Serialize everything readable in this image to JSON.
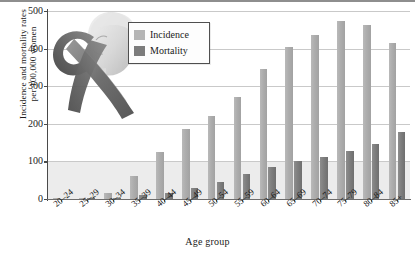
{
  "chart_data": {
    "type": "bar",
    "title": "",
    "xlabel": "Age group",
    "ylabel": "Incidence and mortality rates per 100,000 women",
    "ylabel_line1": "Incidence and mortality rates",
    "ylabel_line2": "per 100,000 women",
    "ylim": [
      0,
      500
    ],
    "yticks": [
      0,
      100,
      200,
      300,
      400,
      500
    ],
    "ytick_labels": [
      "0",
      "100",
      "200",
      "300",
      "400",
      "500"
    ],
    "grid": true,
    "legend_position": "top-left-inset",
    "categories": [
      "20–24",
      "25–29",
      "30–34",
      "35–39",
      "40–44",
      "45–49",
      "50–54",
      "55–59",
      "60–64",
      "65–69",
      "70–74",
      "75–79",
      "80–84",
      "85+"
    ],
    "series": [
      {
        "name": "Incidence",
        "color": "#b0b0b0",
        "values": [
          1,
          2,
          17,
          62,
          125,
          187,
          220,
          272,
          345,
          405,
          435,
          473,
          462,
          415
        ]
      },
      {
        "name": "Mortality",
        "color": "#7c7c7c",
        "values": [
          0,
          1,
          3,
          10,
          17,
          29,
          46,
          67,
          85,
          102,
          113,
          129,
          146,
          179
        ]
      }
    ],
    "annotations": [
      "breast-cancer-awareness-ribbon-illustration"
    ]
  },
  "legend": {
    "items": [
      {
        "label": "Incidence",
        "swatch": "incidence-swatch"
      },
      {
        "label": "Mortality",
        "swatch": "mortality-swatch"
      }
    ]
  },
  "decoration": {
    "name": "awareness-ribbon-and-woman-profile",
    "description": "Gray awareness ribbon overlaying a woman's profile illustration"
  },
  "colors": {
    "incidence": "#b0b0b0",
    "mortality": "#7c7c7c",
    "gridline": "#c9c9c9",
    "axis": "#4a4a4a",
    "band": "#ececec",
    "background": "#ffffff"
  }
}
